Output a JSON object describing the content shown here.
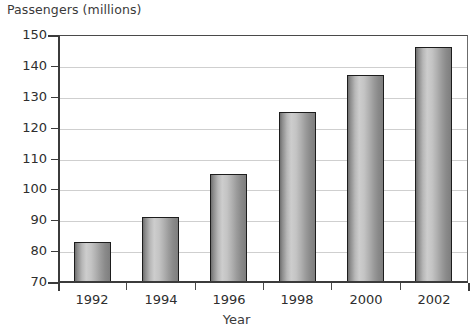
{
  "chart_data": {
    "type": "bar",
    "title": "Passengers (millions)",
    "xlabel": "Year",
    "ylabel": "Passengers (millions)",
    "categories": [
      "1992",
      "1994",
      "1996",
      "1998",
      "2000",
      "2002"
    ],
    "values": [
      83,
      91,
      105,
      125,
      137,
      146
    ],
    "ylim": [
      70,
      150
    ],
    "yticks": [
      70,
      80,
      90,
      100,
      110,
      120,
      130,
      140,
      150
    ],
    "ytick_labels": [
      "70",
      "80",
      "90",
      "100",
      "110",
      "120",
      "130",
      "140",
      "150"
    ],
    "grid": true,
    "grid_axis": "y",
    "legend": false,
    "legend_position": "none",
    "series": [
      {
        "name": "Passengers",
        "values": [
          83,
          91,
          105,
          125,
          137,
          146
        ]
      }
    ],
    "bar_style": "cylinder-gradient-grayscale",
    "colors": {
      "bar_edge": "#1d1d1d",
      "bar_light": "#cdcdcd",
      "bar_dark": "#6f6f6f",
      "axis": "#3b3b3b",
      "gridline": "#cfcfcf",
      "text": "#2e2e2e",
      "background": "#ffffff"
    },
    "annotations": []
  }
}
